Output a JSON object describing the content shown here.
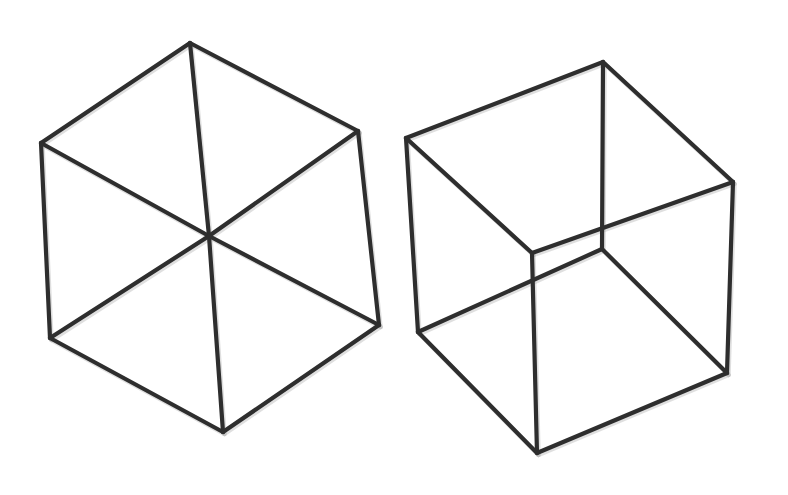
{
  "figure": {
    "background": "#ffffff",
    "line_color": "#2e2e2e",
    "line_width": 4.2
  },
  "cubes": [
    {
      "name": "left-cube-hexagon-view",
      "vertices": {
        "top": [
          190,
          43
        ],
        "upper_left": [
          41,
          143
        ],
        "upper_right": [
          358,
          131
        ],
        "center": [
          209,
          236
        ],
        "lower_left": [
          50,
          338
        ],
        "lower_right": [
          379,
          325
        ],
        "bottom": [
          223,
          432
        ]
      },
      "edges": [
        [
          "top",
          "upper_left"
        ],
        [
          "top",
          "upper_right"
        ],
        [
          "top",
          "center"
        ],
        [
          "upper_left",
          "center"
        ],
        [
          "upper_right",
          "center"
        ],
        [
          "upper_left",
          "lower_left"
        ],
        [
          "upper_right",
          "lower_right"
        ],
        [
          "center",
          "lower_left"
        ],
        [
          "center",
          "lower_right"
        ],
        [
          "center",
          "bottom"
        ],
        [
          "lower_left",
          "bottom"
        ],
        [
          "lower_right",
          "bottom"
        ]
      ]
    },
    {
      "name": "right-cube-necker-view",
      "vertices": {
        "top_left": [
          406,
          138
        ],
        "top_back": [
          603,
          62
        ],
        "top_right": [
          733,
          182
        ],
        "top_front": [
          532,
          253
        ],
        "bottom_left": [
          418,
          332
        ],
        "bottom_back": [
          602,
          249
        ],
        "bottom_right": [
          727,
          373
        ],
        "bottom_front": [
          537,
          453
        ]
      },
      "edges": [
        [
          "top_left",
          "top_back"
        ],
        [
          "top_back",
          "top_right"
        ],
        [
          "top_right",
          "top_front"
        ],
        [
          "top_front",
          "top_left"
        ],
        [
          "bottom_left",
          "bottom_back"
        ],
        [
          "bottom_back",
          "bottom_right"
        ],
        [
          "bottom_right",
          "bottom_front"
        ],
        [
          "bottom_front",
          "bottom_left"
        ],
        [
          "top_left",
          "bottom_left"
        ],
        [
          "top_back",
          "bottom_back"
        ],
        [
          "top_right",
          "bottom_right"
        ],
        [
          "top_front",
          "bottom_front"
        ]
      ]
    }
  ]
}
